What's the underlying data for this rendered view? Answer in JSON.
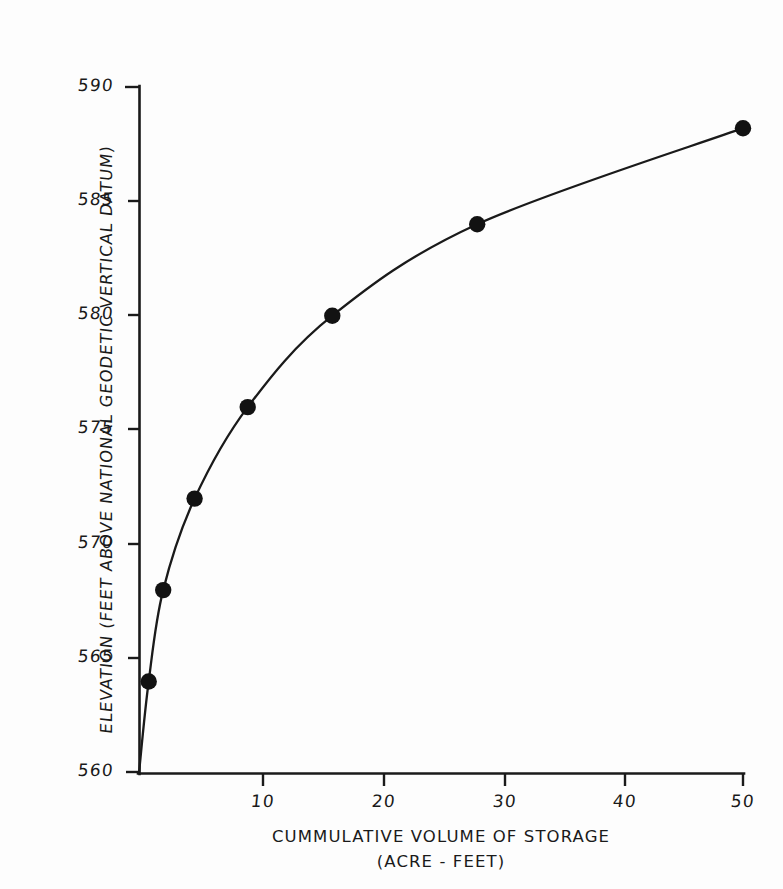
{
  "figure": {
    "kind": "hand-drafted-engineering-chart",
    "background_color": "#fdfdfd",
    "ink_color": "#1a1a1a"
  },
  "axes": {
    "y_title": "ELEVATION (FEET ABOVE NATIONAL GEODETIC VERTICAL DATUM)",
    "x_title_line1": "CUMMULATIVE VOLUME OF STORAGE",
    "x_title_line2": "(ACRE - FEET)",
    "y_ticks": [
      "560",
      "565",
      "570",
      "575",
      "580",
      "585",
      "590"
    ],
    "x_ticks": [
      "10",
      "20",
      "30",
      "40",
      "50"
    ]
  },
  "chart_data": {
    "type": "line",
    "title": "",
    "subtitle": "",
    "xlabel": "CUMMULATIVE VOLUME OF STORAGE (ACRE - FEET)",
    "ylabel": "ELEVATION (FEET ABOVE NATIONAL GEODETIC VERTICAL DATUM)",
    "xlim": [
      0,
      50
    ],
    "ylim": [
      560,
      590
    ],
    "xticks": [
      10,
      20,
      30,
      40,
      50
    ],
    "yticks": [
      560,
      565,
      570,
      575,
      580,
      585,
      590
    ],
    "grid": false,
    "legend": false,
    "legend_position": "none",
    "marker": "filled-circle",
    "marker_color": "#121212",
    "line_color": "#1a1a1a",
    "series": [
      {
        "name": "Stage-storage curve",
        "x": [
          0,
          0.8,
          2.0,
          4.6,
          9.0,
          16.0,
          28.0,
          50.0
        ],
        "y": [
          560.0,
          564.0,
          568.0,
          572.0,
          576.0,
          580.0,
          584.0,
          588.2
        ]
      }
    ],
    "data_points": [
      {
        "x": 0.8,
        "y": 564.0
      },
      {
        "x": 2.0,
        "y": 568.0
      },
      {
        "x": 4.6,
        "y": 572.0
      },
      {
        "x": 9.0,
        "y": 576.0
      },
      {
        "x": 16.0,
        "y": 580.0
      },
      {
        "x": 28.0,
        "y": 584.0
      },
      {
        "x": 50.0,
        "y": 588.2
      }
    ],
    "annotations": []
  }
}
